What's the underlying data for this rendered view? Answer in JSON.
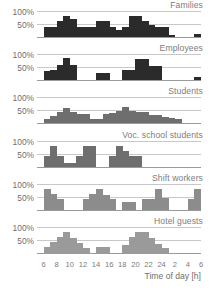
{
  "chart_data": {
    "type": "bar",
    "title": "",
    "xlabel": "Time of day [h]",
    "ylabel": "",
    "ylim": [
      0,
      125
    ],
    "grid": true,
    "legend_position": "panel-title-right",
    "ytick_labels": [
      "100%",
      "50%"
    ],
    "ytick_values": [
      100,
      50
    ],
    "xtick_labels": [
      "6",
      "8",
      "10",
      "12",
      "14",
      "16",
      "18",
      "20",
      "22",
      "24",
      "2",
      "4",
      "6"
    ],
    "xtick_values": [
      6,
      8,
      10,
      12,
      14,
      16,
      18,
      20,
      22,
      24,
      26,
      28,
      30
    ],
    "x_start": 5,
    "x_end": 30,
    "bin_width": 1,
    "panels": [
      {
        "name": "Families",
        "color": "#2b2b2b",
        "x": [
          5,
          6,
          7,
          8,
          9,
          10,
          11,
          12,
          13,
          14,
          15,
          16,
          17,
          18,
          19,
          20,
          21,
          22,
          23,
          24,
          25,
          26,
          27,
          28,
          29
        ],
        "values": [
          0,
          50,
          50,
          75,
          100,
          85,
          50,
          50,
          50,
          75,
          75,
          50,
          35,
          50,
          100,
          100,
          75,
          60,
          50,
          50,
          10,
          0,
          0,
          0,
          15
        ]
      },
      {
        "name": "Employees",
        "color": "#2b2b2b",
        "x": [
          5,
          6,
          7,
          8,
          9,
          10,
          11,
          12,
          13,
          14,
          15,
          16,
          17,
          18,
          19,
          20,
          21,
          22,
          23,
          24,
          25,
          26,
          27,
          28,
          29
        ],
        "values": [
          0,
          45,
          50,
          75,
          105,
          75,
          0,
          0,
          0,
          35,
          35,
          0,
          0,
          50,
          50,
          100,
          100,
          70,
          70,
          0,
          0,
          0,
          0,
          0,
          15
        ]
      },
      {
        "name": "Students",
        "color": "#6e6e6e",
        "x": [
          5,
          6,
          7,
          8,
          9,
          10,
          11,
          12,
          13,
          14,
          15,
          16,
          17,
          18,
          19,
          20,
          21,
          22,
          23,
          24,
          25,
          26,
          27,
          28,
          29
        ],
        "values": [
          0,
          20,
          35,
          55,
          75,
          55,
          45,
          45,
          20,
          20,
          45,
          50,
          60,
          80,
          60,
          55,
          55,
          40,
          40,
          30,
          25,
          20,
          0,
          0,
          0
        ]
      },
      {
        "name": "Voc. school students",
        "color": "#6e6e6e",
        "x": [
          5,
          6,
          7,
          8,
          9,
          10,
          11,
          12,
          13,
          14,
          15,
          16,
          17,
          18,
          19,
          20,
          21,
          22,
          23,
          24,
          25,
          26,
          27,
          28,
          29
        ],
        "values": [
          0,
          50,
          100,
          50,
          15,
          15,
          50,
          100,
          100,
          0,
          0,
          50,
          100,
          75,
          50,
          50,
          0,
          0,
          0,
          0,
          0,
          0,
          0,
          0,
          0
        ]
      },
      {
        "name": "Shift workers",
        "color": "#8c8c8c",
        "x": [
          5,
          6,
          7,
          8,
          9,
          10,
          11,
          12,
          13,
          14,
          15,
          16,
          17,
          18,
          19,
          20,
          21,
          22,
          23,
          24,
          25,
          26,
          27,
          28,
          29
        ],
        "values": [
          0,
          100,
          75,
          50,
          0,
          0,
          0,
          50,
          75,
          100,
          70,
          50,
          0,
          35,
          35,
          0,
          50,
          50,
          100,
          55,
          0,
          0,
          0,
          50,
          100
        ]
      },
      {
        "name": "Hotel guests",
        "color": "#9a9a9a",
        "x": [
          5,
          6,
          7,
          8,
          9,
          10,
          11,
          12,
          13,
          14,
          15,
          16,
          17,
          18,
          19,
          20,
          21,
          22,
          23,
          24,
          25,
          26,
          27,
          28,
          29
        ],
        "values": [
          0,
          30,
          55,
          75,
          100,
          70,
          50,
          25,
          0,
          30,
          30,
          0,
          0,
          40,
          75,
          100,
          100,
          70,
          45,
          25,
          0,
          0,
          0,
          0,
          0
        ]
      }
    ]
  }
}
